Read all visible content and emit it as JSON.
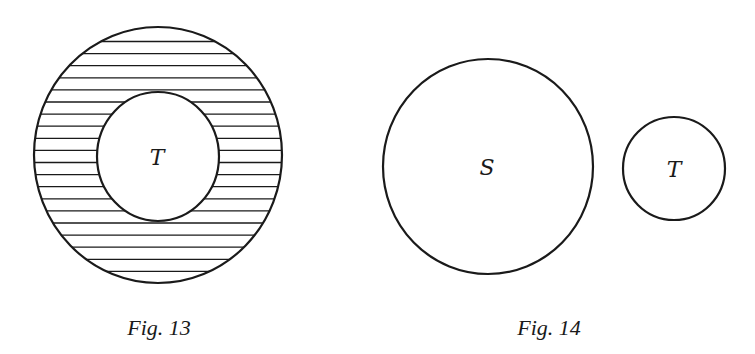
{
  "colors": {
    "background": "#ffffff",
    "stroke": "#1a1a1a",
    "hatch": "#1a1a1a"
  },
  "figures": [
    {
      "id": "fig13",
      "caption": "Fig. 13",
      "caption_pos": {
        "x": 159,
        "y": 335,
        "size": 22
      },
      "outer_set": {
        "cx": 158,
        "cy": 155,
        "rx": 124,
        "ry": 128
      },
      "inner_set": {
        "label": "T",
        "cx": 158,
        "cy": 156.5,
        "rx": 61,
        "ry": 64.5
      },
      "inner_label_pos": {
        "x": 157,
        "y": 165,
        "size": 22
      },
      "hatch": {
        "first_y": 41.5,
        "step": 12.1,
        "count": 20,
        "region": "outer minus inner"
      }
    },
    {
      "id": "fig14",
      "caption": "Fig. 14",
      "caption_pos": {
        "x": 549,
        "y": 335,
        "size": 22
      },
      "sets": [
        {
          "label": "S",
          "cx": 488,
          "cy": 166.5,
          "rx": 105,
          "ry": 107.5,
          "label_x": 487,
          "label_y": 175,
          "label_size": 22
        },
        {
          "label": "T",
          "cx": 674,
          "cy": 168.5,
          "rx": 51,
          "ry": 51.5,
          "label_x": 674,
          "label_y": 177,
          "label_size": 22
        }
      ]
    }
  ]
}
